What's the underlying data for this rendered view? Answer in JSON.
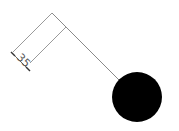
{
  "diagram": {
    "type": "dimensioned-drawing",
    "dimension": {
      "label": "35",
      "orientation": "diagonal"
    },
    "shapes": [
      {
        "kind": "line",
        "role": "geometry-leg",
        "color": "#8a8a8a"
      },
      {
        "kind": "line",
        "role": "extension-line",
        "color": "#8a8a8a"
      },
      {
        "kind": "line",
        "role": "dimension-line",
        "color": "#666666"
      },
      {
        "kind": "circle",
        "role": "filled-node",
        "color": "#000000"
      }
    ],
    "colors": {
      "background": "#ffffff",
      "line": "#8a8a8a",
      "fill": "#000000"
    }
  }
}
